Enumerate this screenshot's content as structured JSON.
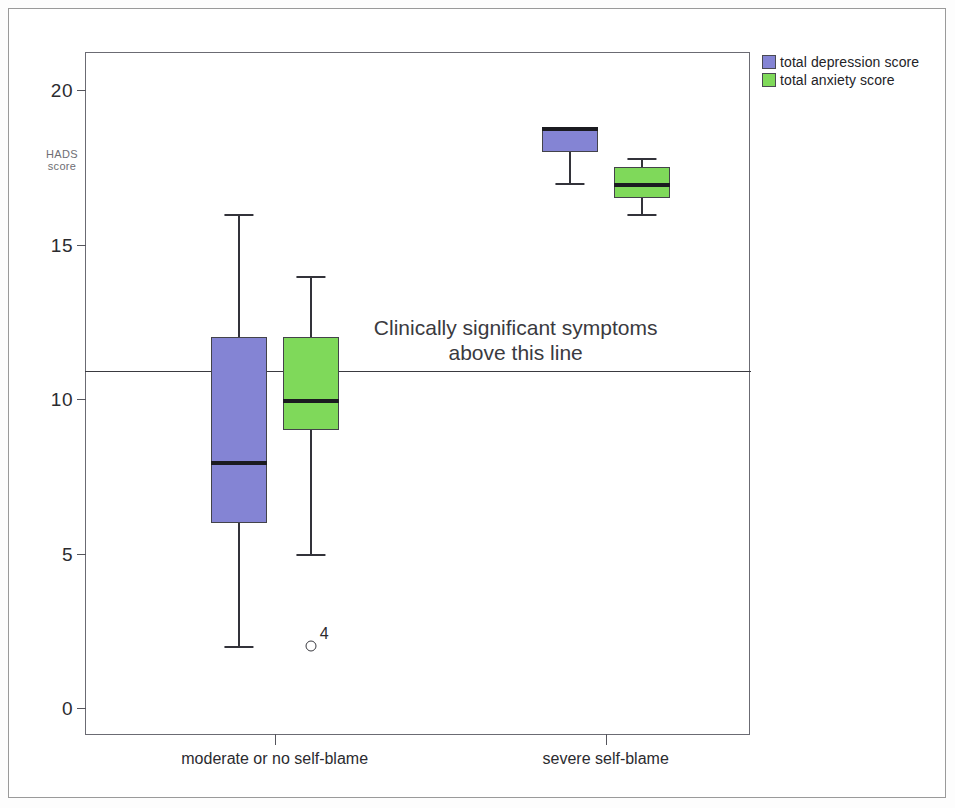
{
  "chart_data": {
    "type": "box",
    "title": "",
    "xlabel": "",
    "ylabel": "HADS score",
    "ylabel_lines": [
      "HADS",
      "score"
    ],
    "ylim": [
      -0.8,
      21.2
    ],
    "yticks": [
      0,
      5,
      10,
      15,
      20
    ],
    "ytick_labels": [
      "0",
      "5",
      "10",
      "15",
      "20"
    ],
    "grid": false,
    "categories": [
      "moderate or no self-blame",
      "severe self-blame"
    ],
    "legend_position": "top-right",
    "legend": [
      "total depression score",
      "total anxiety score"
    ],
    "colors": {
      "depression": "#8484d4",
      "anxiety": "#7fd95a",
      "box_outline": "#43434a",
      "median": "#1b1b20",
      "whisker": "#33333a",
      "axis": "#55555c",
      "frame": "#6b6b73",
      "reference_line": "#3a3a40",
      "text": "#2b2b2f"
    },
    "reference_line": {
      "value": 10.9,
      "label_line1": "Clinically significant symptoms",
      "label_line2": "above this line"
    },
    "series": [
      {
        "name": "total depression score",
        "color": "#8484d4",
        "boxes": [
          {
            "category": "moderate or no self-blame",
            "whisker_low": 2,
            "q1": 6,
            "median": 8,
            "q3": 12,
            "whisker_high": 16,
            "outliers": []
          },
          {
            "category": "severe self-blame",
            "whisker_low": 17,
            "q1": 18,
            "median": 18.8,
            "q3": 18.8,
            "whisker_high": 18.8,
            "outliers": []
          }
        ]
      },
      {
        "name": "total anxiety score",
        "color": "#7fd95a",
        "boxes": [
          {
            "category": "moderate or no self-blame",
            "whisker_low": 5,
            "q1": 9,
            "median": 10,
            "q3": 12,
            "whisker_high": 14,
            "outliers": [
              {
                "value": 2,
                "label": "4"
              }
            ]
          },
          {
            "category": "severe self-blame",
            "whisker_low": 16,
            "q1": 16.5,
            "median": 17,
            "q3": 17.5,
            "whisker_high": 17.8,
            "outliers": []
          }
        ]
      }
    ]
  }
}
